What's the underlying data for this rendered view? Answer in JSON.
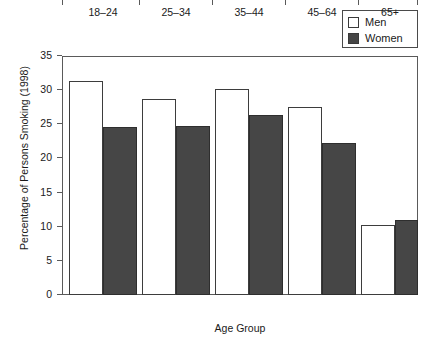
{
  "chart_data": {
    "type": "bar",
    "title": "",
    "xlabel": "Age Group",
    "ylabel": "Percentage of Persons Smoking (1998)",
    "categories": [
      "18–24",
      "25–34",
      "35–44",
      "45–64",
      "65+"
    ],
    "series": [
      {
        "name": "Men",
        "color": "#ffffff",
        "values": [
          31.4,
          28.7,
          30.1,
          27.5,
          10.2
        ]
      },
      {
        "name": "Women",
        "color": "#464646",
        "values": [
          24.6,
          24.7,
          26.4,
          22.3,
          11.0
        ]
      }
    ],
    "ylim": [
      0,
      35
    ],
    "ytick_labels": [
      "0",
      "5",
      "10",
      "15",
      "20",
      "25",
      "30",
      "35"
    ],
    "ytick_values": [
      0,
      5,
      10,
      15,
      20,
      25,
      30,
      35
    ],
    "grid": false,
    "legend_position": "top-right"
  },
  "legend": {
    "entries": [
      {
        "label": "Men",
        "swatch": "men-swatch-open"
      },
      {
        "label": "Women",
        "swatch": "women-swatch-filled"
      }
    ]
  },
  "axes": {
    "y_title": "Percentage of Persons Smoking (1998)",
    "x_title": "Age Group"
  }
}
